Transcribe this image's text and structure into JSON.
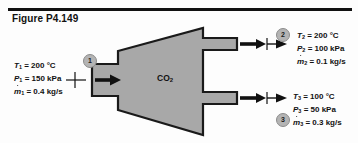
{
  "figure": {
    "title": "Figure P4.149",
    "device_label": "CO",
    "device_label_sub": "2",
    "device_type": "diffuser"
  },
  "colors": {
    "body_fill": "#a8a8a8",
    "body_stroke": "#1a1a1a",
    "badge_fill": "#b4b4b4",
    "badge_stroke": "#8c8c8c",
    "ink": "#111111",
    "page": "#fdfdfd"
  },
  "streams": [
    {
      "id": "inlet-1",
      "badge": "1",
      "direction": "in",
      "lines": [
        {
          "symbol": "T",
          "sub": "1",
          "eq": "=",
          "value": "200",
          "unit": "°C",
          "dot": false
        },
        {
          "symbol": "P",
          "sub": "1",
          "eq": "=",
          "value": "150",
          "unit": "kPa",
          "dot": false
        },
        {
          "symbol": "m",
          "sub": "1",
          "eq": "=",
          "value": "0.4",
          "unit": "kg/s",
          "dot": true
        }
      ]
    },
    {
      "id": "outlet-2",
      "badge": "2",
      "direction": "out",
      "lines": [
        {
          "symbol": "T",
          "sub": "2",
          "eq": "=",
          "value": "200",
          "unit": "°C",
          "dot": false
        },
        {
          "symbol": "P",
          "sub": "2",
          "eq": "=",
          "value": "100",
          "unit": "kPa",
          "dot": false
        },
        {
          "symbol": "m",
          "sub": "2",
          "eq": "=",
          "value": "0.1",
          "unit": "kg/s",
          "dot": true
        }
      ]
    },
    {
      "id": "outlet-3",
      "badge": "3",
      "direction": "out",
      "lines": [
        {
          "symbol": "T",
          "sub": "3",
          "eq": "=",
          "value": "100",
          "unit": "°C",
          "dot": false
        },
        {
          "symbol": "P",
          "sub": "3",
          "eq": "=",
          "value": "50",
          "unit": "kPa",
          "dot": false
        },
        {
          "symbol": "m",
          "sub": "3",
          "eq": "=",
          "value": "0.3",
          "unit": "kg/s",
          "dot": true
        }
      ]
    }
  ]
}
